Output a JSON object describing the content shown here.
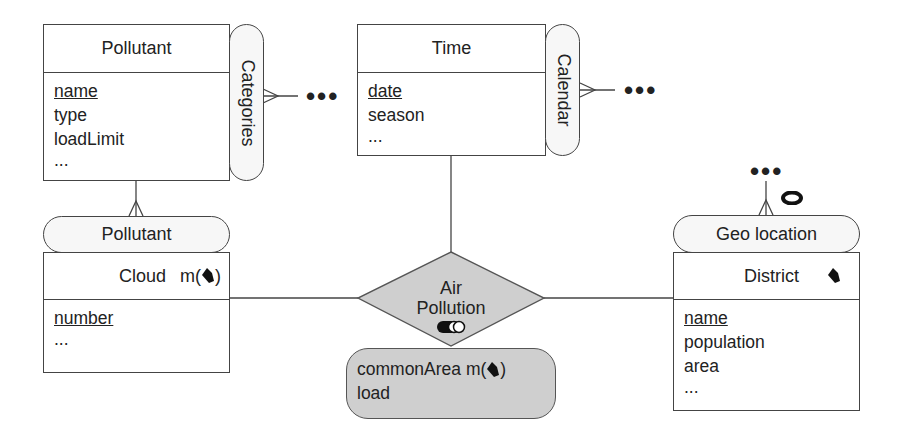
{
  "entities": {
    "pollutant": {
      "title": "Pollutant",
      "attributes": [
        {
          "name": "name",
          "key": true
        },
        {
          "name": "type",
          "key": false
        },
        {
          "name": "loadLimit",
          "key": false
        },
        {
          "name": "...",
          "key": false
        }
      ],
      "hierarchy": "Categories"
    },
    "time": {
      "title": "Time",
      "attributes": [
        {
          "name": "date",
          "key": true
        },
        {
          "name": "season",
          "key": false
        },
        {
          "name": "...",
          "key": false
        }
      ],
      "hierarchy": "Calendar"
    },
    "cloud": {
      "title": "Cloud",
      "spatial_marker": "m(",
      "spatial_marker_close": ")",
      "spatial_icon": "polygon-icon",
      "attributes": [
        {
          "name": "number",
          "key": true
        },
        {
          "name": "...",
          "key": false
        }
      ],
      "hierarchy": "Pollutant"
    },
    "district": {
      "title": "District",
      "spatial_icon": "polygon-icon",
      "attributes": [
        {
          "name": "name",
          "key": true
        },
        {
          "name": "population",
          "key": false
        },
        {
          "name": "area",
          "key": false
        },
        {
          "name": "...",
          "key": false
        }
      ],
      "hierarchy": "Geo location",
      "hierarchy_icon": "topological-ring-icon"
    }
  },
  "relationship": {
    "label_line1": "Air",
    "label_line2": "Pollution",
    "icon": "topological-overlap-icon",
    "attributes": [
      {
        "name": "commonArea m(",
        "suffix": ")",
        "spatial_icon": "polygon-icon"
      },
      {
        "name": "load"
      }
    ]
  },
  "ellipsis": {
    "categories": "•••",
    "calendar": "•••",
    "geo": "•••"
  },
  "colors": {
    "line": "#444444",
    "relationship_fill": "#cfcfcf",
    "pill_fill": "#f7f7f7"
  }
}
